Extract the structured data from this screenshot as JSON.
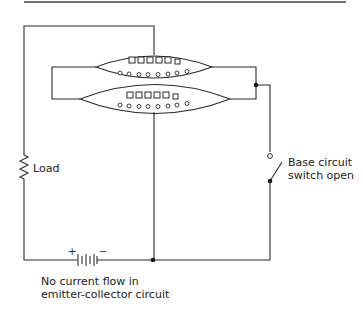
{
  "diagram": {
    "type": "transistor-circuit-schematic",
    "labels": {
      "load": "Load",
      "switch_line1": "Base circuit",
      "switch_line2": "switch open",
      "caption_line1": "No current flow in",
      "caption_line2": "emitter-collector circuit",
      "battery_plus": "+",
      "battery_minus": "−"
    },
    "components": {
      "transistor": {
        "layers": 2,
        "holes_per_layer": 6,
        "electrons_per_layer": 8
      },
      "load": {
        "symbol": "resistor-zigzag"
      },
      "battery": {
        "symbol": "battery-multicell"
      },
      "switch": {
        "state": "open"
      }
    },
    "colors": {
      "line": "#2a2a2a",
      "background": "#ffffff"
    }
  }
}
